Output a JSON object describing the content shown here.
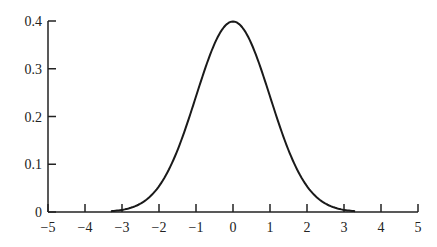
{
  "chart_data": {
    "type": "line",
    "title": "",
    "xlabel": "",
    "ylabel": "",
    "xlim": [
      -5,
      5
    ],
    "ylim": [
      0,
      0.4
    ],
    "grid": false,
    "legend": null,
    "x_ticks": [
      "−5",
      "−4",
      "−3",
      "−2",
      "−1",
      "0",
      "1",
      "2",
      "3",
      "4",
      "5"
    ],
    "y_ticks": [
      "0",
      "0.1",
      "0.2",
      "0.3",
      "0.4"
    ],
    "series": [
      {
        "name": "standard normal density",
        "x": [
          -3.3,
          -3.0,
          -2.5,
          -2.0,
          -1.5,
          -1.0,
          -0.5,
          0.0,
          0.5,
          1.0,
          1.5,
          2.0,
          2.5,
          3.0,
          3.3
        ],
        "y": [
          0.002,
          0.004,
          0.018,
          0.054,
          0.13,
          0.242,
          0.352,
          0.399,
          0.352,
          0.242,
          0.13,
          0.054,
          0.018,
          0.004,
          0.002
        ]
      }
    ]
  },
  "axis": {
    "x_tick_values": [
      -5,
      -4,
      -3,
      -2,
      -1,
      0,
      1,
      2,
      3,
      4,
      5
    ],
    "y_tick_values": [
      0,
      0.1,
      0.2,
      0.3,
      0.4
    ]
  }
}
